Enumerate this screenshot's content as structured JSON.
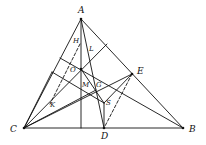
{
  "colors": {
    "stroke": "#111111",
    "background": "#ffffff"
  },
  "points": {
    "A": {
      "label": "A",
      "x": 81,
      "y": 19
    },
    "B": {
      "label": "B",
      "x": 183,
      "y": 128
    },
    "C": {
      "label": "C",
      "x": 24,
      "y": 128
    },
    "D": {
      "label": "D",
      "x": 104,
      "y": 128
    },
    "E": {
      "label": "E",
      "x": 132,
      "y": 74
    },
    "O": {
      "label": "O",
      "x": 81,
      "y": 69
    },
    "S": {
      "label": "S",
      "x": 104,
      "y": 103
    },
    "H": {
      "label": "H",
      "x": 75,
      "y": 42
    },
    "L": {
      "label": "L",
      "x": 92,
      "y": 50
    },
    "M": {
      "label": "M",
      "x": 84,
      "y": 85
    },
    "G": {
      "label": "G",
      "x": 97,
      "y": 85
    },
    "K": {
      "label": "K",
      "x": 52,
      "y": 104
    }
  },
  "labels": [
    {
      "id": "A",
      "text": "A",
      "x": 78,
      "y": 6
    },
    {
      "id": "B",
      "text": "B",
      "x": 189,
      "y": 125
    },
    {
      "id": "C",
      "text": "C",
      "x": 10,
      "y": 125
    },
    {
      "id": "D",
      "text": "D",
      "x": 101,
      "y": 132
    },
    {
      "id": "E",
      "text": "E",
      "x": 137,
      "y": 67
    },
    {
      "id": "O",
      "text": "O",
      "x": 70,
      "y": 67
    },
    {
      "id": "S",
      "text": "S",
      "x": 106,
      "y": 100
    },
    {
      "id": "H",
      "text": "H",
      "x": 73,
      "y": 38
    },
    {
      "id": "L",
      "text": "L",
      "x": 89,
      "y": 46
    },
    {
      "id": "M",
      "text": "M",
      "x": 82,
      "y": 82
    },
    {
      "id": "G",
      "text": "G",
      "x": 96,
      "y": 82
    },
    {
      "id": "K",
      "text": "K",
      "x": 50,
      "y": 102
    }
  ],
  "segments": [
    {
      "name": "side-AB",
      "x1": 81,
      "y1": 19,
      "x2": 183,
      "y2": 128,
      "dashed": false
    },
    {
      "name": "side-AC",
      "x1": 81,
      "y1": 19,
      "x2": 24,
      "y2": 128,
      "dashed": false
    },
    {
      "name": "side-CB",
      "x1": 24,
      "y1": 128,
      "x2": 183,
      "y2": 128,
      "dashed": false
    },
    {
      "name": "altitude-A",
      "x1": 81,
      "y1": 19,
      "x2": 81,
      "y2": 128,
      "dashed": false
    },
    {
      "name": "segment-AD",
      "x1": 81,
      "y1": 19,
      "x2": 104,
      "y2": 128,
      "dashed": false
    },
    {
      "name": "segment-CE",
      "x1": 24,
      "y1": 128,
      "x2": 132,
      "y2": 74,
      "dashed": false
    },
    {
      "name": "segment-CO-ext",
      "x1": 24,
      "y1": 128,
      "x2": 107,
      "y2": 44,
      "dashed": false
    },
    {
      "name": "segment-O-B",
      "x1": 60,
      "y1": 58,
      "x2": 183,
      "y2": 128,
      "dashed": false
    },
    {
      "name": "segment-par-1",
      "x1": 52,
      "y1": 72,
      "x2": 104,
      "y2": 103,
      "dashed": false
    },
    {
      "name": "segment-O-S",
      "x1": 81,
      "y1": 69,
      "x2": 104,
      "y2": 103,
      "dashed": false
    },
    {
      "name": "segment-S-E",
      "x1": 104,
      "y1": 103,
      "x2": 132,
      "y2": 74,
      "dashed": false
    },
    {
      "name": "segment-S-D",
      "x1": 104,
      "y1": 103,
      "x2": 104,
      "y2": 128,
      "dashed": false
    },
    {
      "name": "segment-ED-dashed",
      "x1": 132,
      "y1": 74,
      "x2": 104,
      "y2": 128,
      "dashed": true
    },
    {
      "name": "segment-HK-dashed",
      "x1": 80,
      "y1": 44,
      "x2": 50,
      "y2": 104,
      "dashed": true
    },
    {
      "name": "segment-C-fan-1",
      "x1": 24,
      "y1": 128,
      "x2": 52,
      "y2": 72,
      "dashed": false
    },
    {
      "name": "segment-C-fan-2",
      "x1": 24,
      "y1": 128,
      "x2": 96,
      "y2": 90,
      "dashed": false
    }
  ]
}
